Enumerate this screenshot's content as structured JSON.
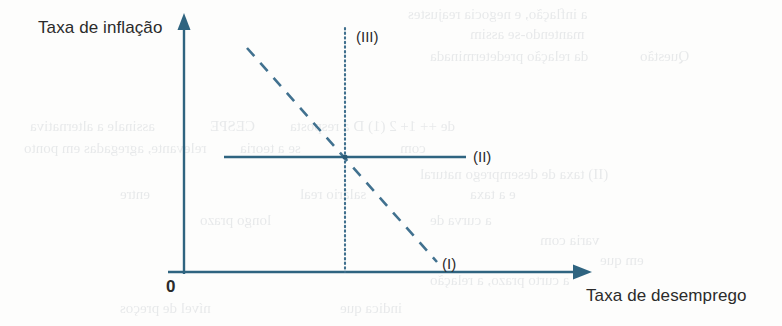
{
  "figure": {
    "type": "phillips-curve-diagram",
    "axes": {
      "y_label": "Taxa de inflação",
      "x_label": "Taxa de desemprego",
      "origin_label": "0"
    },
    "curves": [
      {
        "id": "I",
        "label": "(I)",
        "style": "dashed",
        "description": "downward-sloping short-run Phillips curve",
        "color": "#3f6f8d"
      },
      {
        "id": "II",
        "label": "(II)",
        "style": "solid",
        "description": "horizontal line",
        "color": "#2f6480"
      },
      {
        "id": "III",
        "label": "(III)",
        "style": "dotted",
        "description": "vertical long-run Phillips curve",
        "color": "#3f6f8d"
      }
    ],
    "colors": {
      "axis": "#2f6480",
      "line": "#3f6f8d",
      "text": "#2b2b2b",
      "background": "#fdfdfc"
    }
  },
  "chart_data": {
    "type": "line",
    "title": "",
    "xlabel": "Taxa de desemprego",
    "ylabel": "Taxa de inflação",
    "grid": false,
    "legend": "inline-end-labels",
    "intersection": {
      "x": 345,
      "y": 157
    },
    "series": [
      {
        "name": "(I)",
        "style": "dashed",
        "points": [
          [
            247,
            48
          ],
          [
            437,
            262
          ]
        ]
      },
      {
        "name": "(II)",
        "style": "solid",
        "points": [
          [
            224,
            157
          ],
          [
            466,
            157
          ]
        ]
      },
      {
        "name": "(III)",
        "style": "dotted",
        "points": [
          [
            345,
            28
          ],
          [
            345,
            272
          ]
        ]
      }
    ]
  },
  "ghost_text": {
    "lines": [
      {
        "text": "a inflação, e negocia reajustes",
        "x": 408,
        "y": 6
      },
      {
        "text": "mantendo-se assim",
        "x": 470,
        "y": 26
      },
      {
        "text": "da relação predeterminada",
        "x": 430,
        "y": 48
      },
      {
        "text": "Questão",
        "x": 640,
        "y": 48
      },
      {
        "text": "assinale a alternativa",
        "x": 30,
        "y": 118
      },
      {
        "text": "CESPE",
        "x": 210,
        "y": 118
      },
      {
        "text": "de  ++ 1+  2 (1) D  a resposta",
        "x": 290,
        "y": 118
      },
      {
        "text": "relevante, agregadas em ponto",
        "x": 24,
        "y": 140
      },
      {
        "text": "se a teoria",
        "x": 240,
        "y": 140
      },
      {
        "text": "com",
        "x": 400,
        "y": 140
      },
      {
        "text": "entre",
        "x": 120,
        "y": 186
      },
      {
        "text": "salário real",
        "x": 300,
        "y": 186
      },
      {
        "text": "e a taxa",
        "x": 470,
        "y": 186
      },
      {
        "text": "longo prazo",
        "x": 200,
        "y": 212
      },
      {
        "text": "a curva de",
        "x": 430,
        "y": 212
      },
      {
        "text": "(II) taxa de desemprego natural",
        "x": 420,
        "y": 166
      },
      {
        "text": "varia com",
        "x": 540,
        "y": 232
      },
      {
        "text": "em que",
        "x": 600,
        "y": 252
      },
      {
        "text": "a curto prazo, a relação",
        "x": 430,
        "y": 272
      },
      {
        "text": "nível de preços",
        "x": 120,
        "y": 300
      },
      {
        "text": "indica que",
        "x": 340,
        "y": 300
      }
    ]
  }
}
